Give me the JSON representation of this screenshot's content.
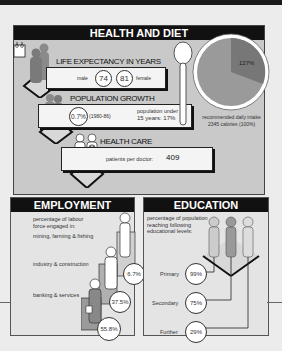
{
  "health": {
    "title": "HEALTH AND DIET",
    "life_expectancy": {
      "label": "LIFE EXPECTANCY IN YEARS",
      "male_label": "male",
      "male_value": "74",
      "female_value": "81",
      "female_label": "female"
    },
    "population_growth": {
      "label": "POPULATION GROWTH",
      "rate": "0.7%",
      "period": "(1980-86)",
      "under15_label": "population under",
      "under15_value": "15 years: 17%"
    },
    "health_care": {
      "label": "HEALTH CARE",
      "patients_label": "patients per doctor:",
      "patients_value": "409"
    },
    "diet": {
      "pie_value": "127%",
      "caption_line1": "recommended daily intake",
      "caption_line2": "2345 calories (100%)"
    }
  },
  "employment": {
    "title": "EMPLOYMENT",
    "intro": "percentage of labour force engaged in:",
    "sectors": [
      {
        "label": "mining, farming & fishing",
        "value": "6.7%"
      },
      {
        "label": "industry & construction",
        "value": "37.5%"
      },
      {
        "label": "banking & services",
        "value": "55.8%"
      }
    ]
  },
  "education": {
    "title": "EDUCATION",
    "intro": "percentage of population reaching following educational levels:",
    "levels": [
      {
        "label": "Primary",
        "value": "99%"
      },
      {
        "label": "Secondary",
        "value": "75%"
      },
      {
        "label": "Further",
        "value": "29%"
      }
    ]
  },
  "colors": {
    "header": "#111111",
    "panel_bg": "#c9c9c9",
    "pie_main": "#9a9a9a",
    "pie_slice": "#777777"
  }
}
